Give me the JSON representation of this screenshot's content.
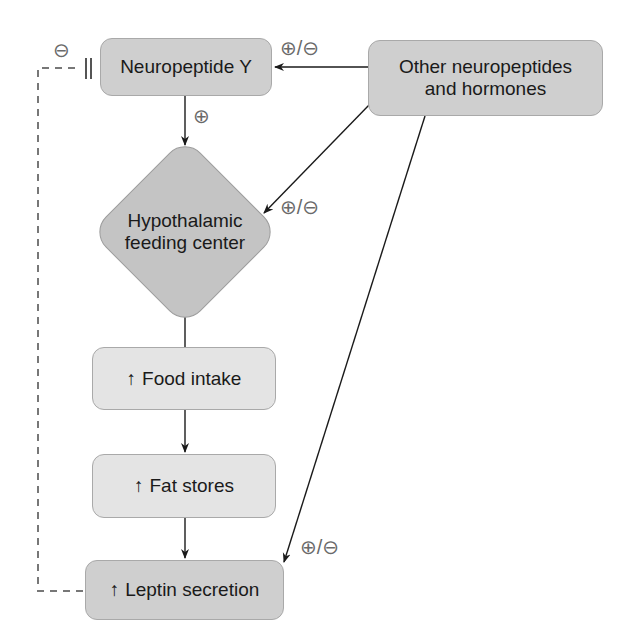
{
  "diagram": {
    "nodes": {
      "npy": {
        "label": "Neuropeptide Y"
      },
      "other": {
        "line1": "Other neuropeptides",
        "line2": "and hormones"
      },
      "hypothalamus": {
        "line1": "Hypothalamic",
        "line2": "feeding center"
      },
      "food": {
        "arrow": "↑",
        "label": "Food intake"
      },
      "fat": {
        "arrow": "↑",
        "label": "Fat stores"
      },
      "leptin": {
        "arrow": "↑",
        "label": "Leptin secretion"
      }
    },
    "edges": [
      {
        "from": "other",
        "to": "npy",
        "sign": "⊕/⊖"
      },
      {
        "from": "npy",
        "to": "hypothalamus",
        "sign": "⊕"
      },
      {
        "from": "other",
        "to": "hypothalamus",
        "sign": "⊕/⊖"
      },
      {
        "from": "hypothalamus",
        "to": "food",
        "sign": ""
      },
      {
        "from": "food",
        "to": "fat",
        "sign": ""
      },
      {
        "from": "fat",
        "to": "leptin",
        "sign": ""
      },
      {
        "from": "other",
        "to": "leptin",
        "sign": "⊕/⊖"
      },
      {
        "from": "leptin",
        "to": "npy",
        "sign": "⊖",
        "style": "dashed-inhibition"
      }
    ],
    "signs": {
      "other_to_npy": "⊕/⊖",
      "npy_to_hypo": "⊕",
      "other_to_hypo": "⊕/⊖",
      "other_to_leptin": "⊕/⊖",
      "leptin_inhibits_npy": "⊖"
    },
    "colors": {
      "dark_node": "#cfcfcf",
      "light_node": "#e4e4e4",
      "line": "#1a1a1a",
      "dashed": "#777777"
    }
  }
}
